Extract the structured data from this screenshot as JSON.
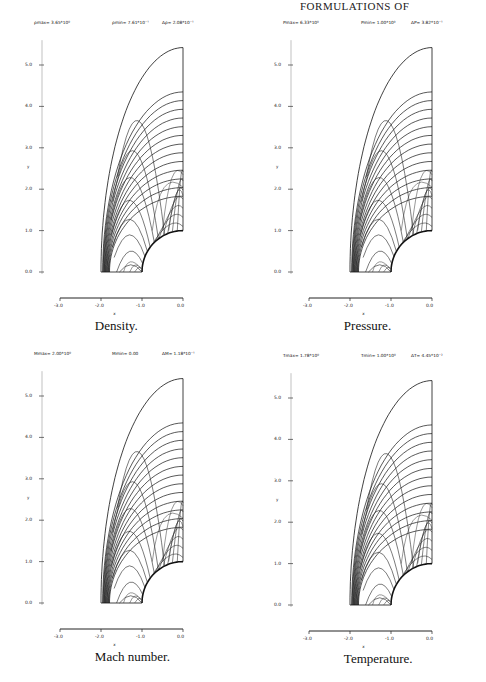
{
  "page": {
    "running_head": "FORMULATIONS OF"
  },
  "chart_data": [
    {
      "type": "contour",
      "title": "Density.",
      "header": {
        "max_label": "ρmax= 3.65*10⁰",
        "min_label": "ρmin= 7.61*10⁻¹",
        "delta_label": "Δρ= 2.08*10⁻¹"
      },
      "xlabel": "x",
      "ylabel": "y",
      "xlim": [
        -3.0,
        0.0
      ],
      "ylim": [
        0.0,
        5.5
      ],
      "xticks": [
        "-3.0",
        "-2.0",
        "-1.0",
        "0.0"
      ],
      "yticks": [
        "0.0",
        "1.0",
        "2.0",
        "3.0",
        "4.0",
        "5.0"
      ],
      "grid": false,
      "domain": {
        "outer_boundary": "quarter-ellipse from (-2.0,0) to (0,5.4)",
        "body": "quarter-circle radius 1.0"
      },
      "shock_x_at_axis": -1.85
    },
    {
      "type": "contour",
      "title": "Pressure.",
      "header": {
        "max_label": "Pmax= 6.33*10⁰",
        "min_label": "Pmin= 1.00*10⁰",
        "delta_label": "ΔP= 3.82*10⁻¹"
      },
      "xlabel": "x",
      "ylabel": "y",
      "xlim": [
        -3.0,
        0.0
      ],
      "ylim": [
        0.0,
        5.5
      ],
      "xticks": [
        "-3.0",
        "-2.0",
        "-1.0",
        "0.0"
      ],
      "yticks": [
        "0.0",
        "1.0",
        "2.0",
        "3.0",
        "4.0",
        "5.0"
      ],
      "grid": false,
      "domain": {
        "outer_boundary": "quarter-ellipse from (-2.0,0) to (0,5.4)",
        "body": "quarter-circle radius 1.0"
      },
      "shock_x_at_axis": -1.85
    },
    {
      "type": "contour",
      "title": "Mach number.",
      "header": {
        "max_label": "Mmax= 2.00*10⁰",
        "min_label": "Mmin= 0.00",
        "delta_label": "ΔM= 1.18*10⁻¹"
      },
      "xlabel": "x",
      "ylabel": "y",
      "xlim": [
        -3.0,
        0.0
      ],
      "ylim": [
        0.0,
        5.5
      ],
      "xticks": [
        "-3.0",
        "-2.0",
        "-1.0",
        "0.0"
      ],
      "yticks": [
        "0.0",
        "1.0",
        "2.0",
        "3.0",
        "4.0",
        "5.0"
      ],
      "grid": false,
      "domain": {
        "outer_boundary": "quarter-ellipse from (-2.0,0) to (0,5.4)",
        "body": "quarter-circle radius 1.0"
      },
      "shock_x_at_axis": -1.85
    },
    {
      "type": "contour",
      "title": "Temperature.",
      "header": {
        "max_label": "Tmax= 1.78*10⁰",
        "min_label": "Tmin= 1.00*10⁰",
        "delta_label": "ΔT= 4.45*10⁻²"
      },
      "xlabel": "x",
      "ylabel": "y",
      "xlim": [
        -3.0,
        0.0
      ],
      "ylim": [
        0.0,
        5.5
      ],
      "xticks": [
        "-3.0",
        "-2.0",
        "-1.0",
        "0.0"
      ],
      "yticks": [
        "0.0",
        "1.0",
        "2.0",
        "3.0",
        "4.0",
        "5.0"
      ],
      "grid": false,
      "domain": {
        "outer_boundary": "quarter-ellipse from (-2.0,0) to (0,5.4)",
        "body": "quarter-circle radius 1.0"
      },
      "shock_x_at_axis": -1.85
    }
  ]
}
